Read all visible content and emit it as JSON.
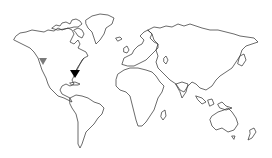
{
  "map": {
    "type": "world-outline",
    "projection": "equirectangular",
    "background": "#ffffff",
    "outline_color": "#3a3a3a"
  },
  "markers": [
    {
      "id": "west-coast",
      "shape": "triangle-down",
      "color": "#7a7a7a",
      "x": 43,
      "y": 62
    },
    {
      "id": "southeast",
      "shape": "triangle-down",
      "color": "#000000",
      "x": 74,
      "y": 74
    }
  ],
  "route": {
    "from": "southeast",
    "to": [
      84,
      58
    ],
    "color": "#333333"
  }
}
